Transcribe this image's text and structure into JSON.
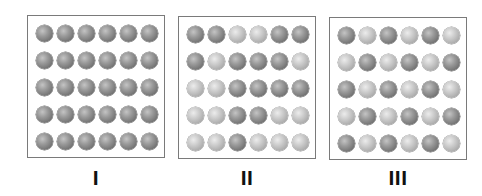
{
  "figure": {
    "panels": [
      {
        "label": "I",
        "rows": [
          [
            "dark",
            "dark",
            "dark",
            "dark",
            "dark",
            "dark"
          ],
          [
            "dark",
            "dark",
            "dark",
            "dark",
            "dark",
            "dark"
          ],
          [
            "dark",
            "dark",
            "dark",
            "dark",
            "dark",
            "dark"
          ],
          [
            "dark",
            "dark",
            "dark",
            "dark",
            "dark",
            "dark"
          ],
          [
            "dark",
            "dark",
            "dark",
            "dark",
            "dark",
            "dark"
          ]
        ]
      },
      {
        "label": "II",
        "rows": [
          [
            "dark",
            "dark",
            "light",
            "light",
            "dark",
            "dark"
          ],
          [
            "dark",
            "light",
            "dark",
            "dark",
            "dark",
            "light"
          ],
          [
            "light",
            "light",
            "dark",
            "dark",
            "dark",
            "dark"
          ],
          [
            "light",
            "light",
            "dark",
            "dark",
            "light",
            "light"
          ],
          [
            "light",
            "light",
            "dark",
            "light",
            "light",
            "light"
          ]
        ]
      },
      {
        "label": "III",
        "rows": [
          [
            "dark",
            "light",
            "dark",
            "light",
            "dark",
            "light"
          ],
          [
            "light",
            "dark",
            "light",
            "dark",
            "light",
            "dark"
          ],
          [
            "dark",
            "light",
            "dark",
            "light",
            "dark",
            "light"
          ],
          [
            "light",
            "dark",
            "light",
            "dark",
            "light",
            "dark"
          ],
          [
            "dark",
            "light",
            "dark",
            "light",
            "dark",
            "light"
          ]
        ]
      }
    ],
    "colors": {
      "dark_sphere": "#767676",
      "light_sphere": "#bdbdbd",
      "border": "#7a7a7a",
      "label": "#111111"
    }
  }
}
